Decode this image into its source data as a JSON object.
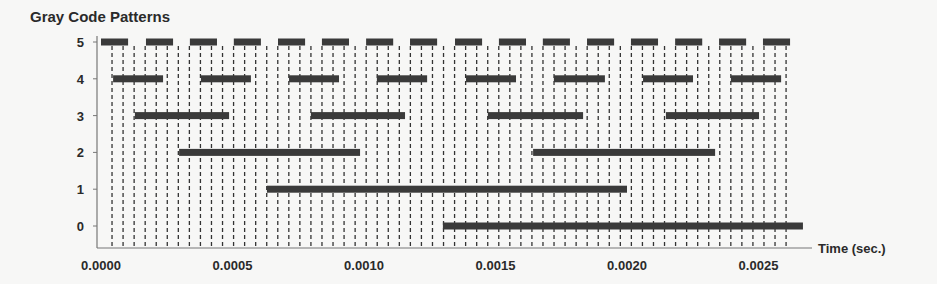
{
  "chart_data": {
    "type": "bar",
    "subtype": "timeline",
    "title": "Gray Code Patterns",
    "xlabel": "Time (sec.)",
    "ylabel": "",
    "xlim": [
      0.0,
      0.0027
    ],
    "ylim": [
      0,
      5
    ],
    "x_ticks": [
      "0.0000",
      "0.0005",
      "0.0010",
      "0.0015",
      "0.0020",
      "0.0025"
    ],
    "x_tick_values": [
      0.0,
      0.0005,
      0.001,
      0.0015,
      0.002,
      0.0025
    ],
    "y_ticks": [
      "0",
      "1",
      "2",
      "3",
      "4",
      "5"
    ],
    "grid": "vertical dashed lines at each step boundary",
    "bar_color": "#3a3a3a",
    "series": [
      {
        "name": "5",
        "row": 5,
        "intervals": [
          [
            0.0,
            0.000103
          ],
          [
            0.000171,
            0.000274
          ],
          [
            0.000338,
            0.000441
          ],
          [
            0.000505,
            0.000608
          ],
          [
            0.000673,
            0.000776
          ],
          [
            0.00084,
            0.000943
          ],
          [
            0.001008,
            0.001111
          ],
          [
            0.001175,
            0.001278
          ],
          [
            0.001346,
            0.001449
          ],
          [
            0.001513,
            0.001616
          ],
          [
            0.00168,
            0.001783
          ],
          [
            0.001848,
            0.001951
          ],
          [
            0.002015,
            0.002118
          ],
          [
            0.002183,
            0.002286
          ],
          [
            0.00235,
            0.002453
          ],
          [
            0.002517,
            0.00262
          ]
        ]
      },
      {
        "name": "4",
        "row": 4,
        "intervals": [
          [
            4.6e-05,
            0.000236
          ],
          [
            0.00038,
            0.00057
          ],
          [
            0.000715,
            0.000905
          ],
          [
            0.001049,
            0.00124
          ],
          [
            0.001388,
            0.001578
          ],
          [
            0.001722,
            0.001916
          ],
          [
            0.002061,
            0.002251
          ],
          [
            0.002395,
            0.002586
          ]
        ]
      },
      {
        "name": "3",
        "row": 3,
        "intervals": [
          [
            0.000129,
            0.000487
          ],
          [
            0.000798,
            0.001156
          ],
          [
            0.001471,
            0.001833
          ],
          [
            0.002148,
            0.002502
          ]
        ]
      },
      {
        "name": "2",
        "row": 2,
        "intervals": [
          [
            0.000297,
            0.000985
          ],
          [
            0.001643,
            0.002335
          ]
        ]
      },
      {
        "name": "1",
        "row": 1,
        "intervals": [
          [
            0.000631,
            0.002
          ],
          [
            0.0,
            0.0
          ]
        ]
      },
      {
        "name": "0",
        "row": 0,
        "intervals": [
          [
            0.0013,
            0.002669
          ]
        ]
      }
    ],
    "step_lines": 62
  }
}
